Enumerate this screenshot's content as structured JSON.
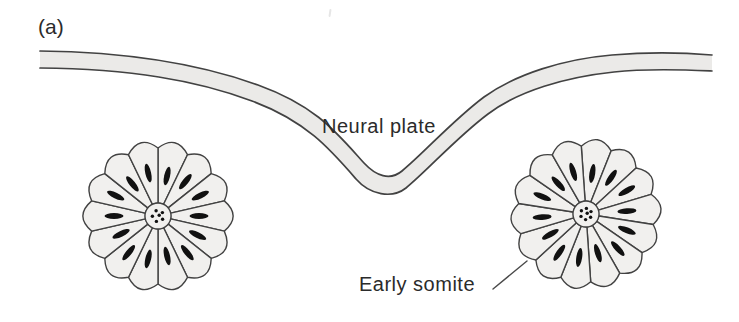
{
  "figure": {
    "panel_label": "(a)",
    "neural_plate_label": "Neural plate",
    "early_somite_label": "Early somite",
    "colors": {
      "background": "#ffffff",
      "band_fill": "#ebeae8",
      "cell_fill": "#f1f0ee",
      "outline": "#424242",
      "nucleus": "#111111",
      "leader": "#4a4a4a",
      "text": "#2b2b2b"
    },
    "band": {
      "top_d": "M 40 51 C 130 52 200 64 258 85 C 316 106 336 132 364 163 C 376 176 390 181 402 171 C 424 153 452 121 484 97 C 516 74 564 59 612 55 C 648 52 688 53 712 55",
      "bottom_d": "M 40 68 C 130 69 196 80 252 101 C 306 121 330 149 356 179 C 370 195 392 199 406 188 C 428 170 456 138 488 114 C 518 91 566 77 614 72 C 650 68 690 70 712 71",
      "fill_d": "M 40 51 C 130 52 200 64 258 85 C 316 106 336 132 364 163 C 376 176 390 181 402 171 C 424 153 452 121 484 97 C 516 74 564 59 612 55 C 648 52 688 53 712 55 L 712 71 C 690 70 650 68 614 72 C 566 77 518 91 488 114 C 456 138 428 170 406 188 C 392 199 370 195 356 179 C 330 149 306 121 252 101 C 196 80 130 69 40 68 Z"
    },
    "somites": [
      {
        "name": "left-somite",
        "cx": 158,
        "cy": 216,
        "cells": 14,
        "outer_radius": 68,
        "scallop_bulge": 8,
        "inner_radius": 13,
        "nucleus_orbit": 44,
        "nucleus_rx": 9.5,
        "nucleus_ry": 2.9,
        "lumen_dots": 6,
        "start_angle_deg": -90
      },
      {
        "name": "right-somite",
        "cx": 586,
        "cy": 214,
        "cells": 14,
        "outer_radius": 68,
        "scallop_bulge": 8,
        "inner_radius": 13,
        "nucleus_orbit": 44,
        "nucleus_rx": 9.5,
        "nucleus_ry": 2.9,
        "lumen_dots": 7,
        "start_angle_deg": -94
      }
    ],
    "leader_line": {
      "x1": 493,
      "y1": 289,
      "x2": 527,
      "y2": 261
    }
  }
}
